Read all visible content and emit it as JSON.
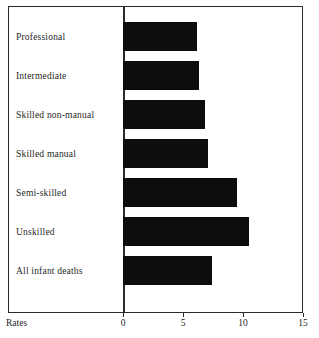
{
  "chart_data": {
    "type": "bar",
    "orientation": "horizontal",
    "title": "",
    "xlabel": "Rates",
    "ylabel": "",
    "categories": [
      "Professional",
      "Intermediate",
      "Skilled non-manual",
      "Skilled manual",
      "Semi-skilled",
      "Unskilled",
      "All infant deaths"
    ],
    "values": [
      6.2,
      6.3,
      6.8,
      7.1,
      9.5,
      10.5,
      7.4
    ],
    "xlim": [
      0,
      15
    ],
    "xticks": [
      0,
      5,
      10,
      15
    ],
    "xtick_labels": [
      "0",
      "5",
      "10",
      "15"
    ],
    "grid": false,
    "legend": false,
    "bar_color": "#0d0d0d",
    "frame_color": "#2b2b2b"
  },
  "axis": {
    "rates_label": "Rates",
    "ticks": [
      {
        "label": "0",
        "value": 0
      },
      {
        "label": "5",
        "value": 5
      },
      {
        "label": "10",
        "value": 10
      },
      {
        "label": "15",
        "value": 15
      }
    ]
  }
}
